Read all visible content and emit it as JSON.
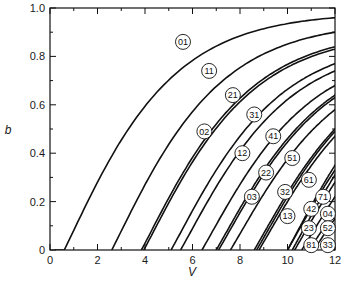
{
  "chart_data": {
    "type": "line",
    "title": "",
    "xlabel": "V",
    "ylabel": "b",
    "xlim": [
      0,
      12
    ],
    "ylim": [
      0,
      1.0
    ],
    "x_ticks": [
      0,
      2,
      4,
      6,
      8,
      10,
      12
    ],
    "x_tick_labels": [
      "0",
      "2",
      "4",
      "6",
      "8",
      "10",
      "12"
    ],
    "y_ticks": [
      0,
      0.2,
      0.4,
      0.6,
      0.8,
      1.0
    ],
    "y_tick_labels": [
      "0",
      "0.2",
      "0.4",
      "0.6",
      "0.8",
      "1.0"
    ],
    "grid": false,
    "legend": "inline circled mode labels",
    "series": [
      {
        "name": "01",
        "cutoff_V": 0.6,
        "b_at_12": 0.96,
        "label_pos": [
          5.6,
          0.86
        ]
      },
      {
        "name": "11",
        "cutoff_V": 2.6,
        "b_at_12": 0.9,
        "label_pos": [
          6.7,
          0.74
        ]
      },
      {
        "name": "21",
        "cutoff_V": 3.85,
        "b_at_12": 0.84,
        "label_pos": [
          7.7,
          0.64
        ]
      },
      {
        "name": "02",
        "cutoff_V": 3.95,
        "b_at_12": 0.83,
        "label_pos": [
          6.5,
          0.49
        ]
      },
      {
        "name": "31",
        "cutoff_V": 5.1,
        "b_at_12": 0.77,
        "label_pos": [
          8.6,
          0.56
        ]
      },
      {
        "name": "12",
        "cutoff_V": 5.5,
        "b_at_12": 0.74,
        "label_pos": [
          8.1,
          0.4
        ]
      },
      {
        "name": "41",
        "cutoff_V": 6.4,
        "b_at_12": 0.68,
        "label_pos": [
          9.4,
          0.47
        ]
      },
      {
        "name": "22",
        "cutoff_V": 7.0,
        "b_at_12": 0.64,
        "label_pos": [
          9.1,
          0.32
        ]
      },
      {
        "name": "03",
        "cutoff_V": 7.1,
        "b_at_12": 0.63,
        "label_pos": [
          8.5,
          0.22
        ]
      },
      {
        "name": "51",
        "cutoff_V": 7.6,
        "b_at_12": 0.58,
        "label_pos": [
          10.2,
          0.38
        ]
      },
      {
        "name": "32",
        "cutoff_V": 8.6,
        "b_at_12": 0.5,
        "label_pos": [
          9.9,
          0.24
        ]
      },
      {
        "name": "13",
        "cutoff_V": 8.7,
        "b_at_12": 0.49,
        "label_pos": [
          10.0,
          0.14
        ]
      },
      {
        "name": "61",
        "cutoff_V": 8.8,
        "b_at_12": 0.47,
        "label_pos": [
          10.9,
          0.29
        ]
      },
      {
        "name": "71",
        "cutoff_V": 10.0,
        "b_at_12": 0.35,
        "label_pos": [
          11.5,
          0.22
        ]
      },
      {
        "name": "42",
        "cutoff_V": 10.0,
        "b_at_12": 0.33,
        "label_pos": [
          11.0,
          0.17
        ]
      },
      {
        "name": "04",
        "cutoff_V": 10.2,
        "b_at_12": 0.31,
        "label_pos": [
          11.7,
          0.15
        ]
      },
      {
        "name": "23",
        "cutoff_V": 10.3,
        "b_at_12": 0.28,
        "label_pos": [
          10.9,
          0.09
        ]
      },
      {
        "name": "52",
        "cutoff_V": 10.6,
        "b_at_12": 0.22,
        "label_pos": [
          11.7,
          0.09
        ]
      },
      {
        "name": "81",
        "cutoff_V": 10.9,
        "b_at_12": 0.16,
        "label_pos": [
          11.0,
          0.02
        ]
      },
      {
        "name": "33",
        "cutoff_V": 11.1,
        "b_at_12": 0.13,
        "label_pos": [
          11.7,
          0.02
        ]
      }
    ]
  }
}
